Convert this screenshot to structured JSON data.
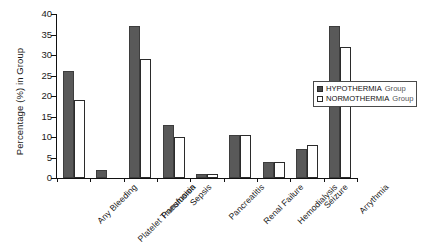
{
  "chart_data": {
    "type": "bar",
    "title": "",
    "subtitle": "",
    "xlabel": "",
    "ylabel": "Percentage (%) in Group",
    "ylim": [
      0,
      40
    ],
    "ytick_step": 5,
    "yticks": [
      "0",
      "5",
      "10",
      "15",
      "20",
      "25",
      "30",
      "35",
      "40"
    ],
    "grid": false,
    "legend_position": "right-inside",
    "categories": [
      "Any Bleeding",
      "Platelet Transfusion",
      "Pneumonia",
      "Sepsis",
      "Pancreatitis",
      "Renal Failure",
      "Hemodialysis",
      "Seizure",
      "Arrythmia"
    ],
    "series": [
      {
        "name": "HYPOTHERMIA Group",
        "color": "#595959",
        "values": [
          26,
          2,
          37,
          13,
          1,
          10.5,
          4,
          7,
          37
        ]
      },
      {
        "name": "NORMOTHERMIA Group",
        "color": "#ffffff",
        "values": [
          19,
          0,
          29,
          10,
          1,
          10.5,
          4,
          8,
          32
        ]
      }
    ]
  },
  "legend": {
    "items": [
      {
        "series_label": "HYPOTHERMIA",
        "group_word": "Group",
        "swatch": "hypothermia-swatch"
      },
      {
        "series_label": "NORMOTHERMIA",
        "group_word": "Group",
        "swatch": "normothermia-swatch"
      }
    ]
  },
  "colors": {
    "hypothermia_fill": "#595959",
    "normothermia_fill": "#ffffff",
    "axis": "#111111",
    "background": "#ffffff"
  }
}
